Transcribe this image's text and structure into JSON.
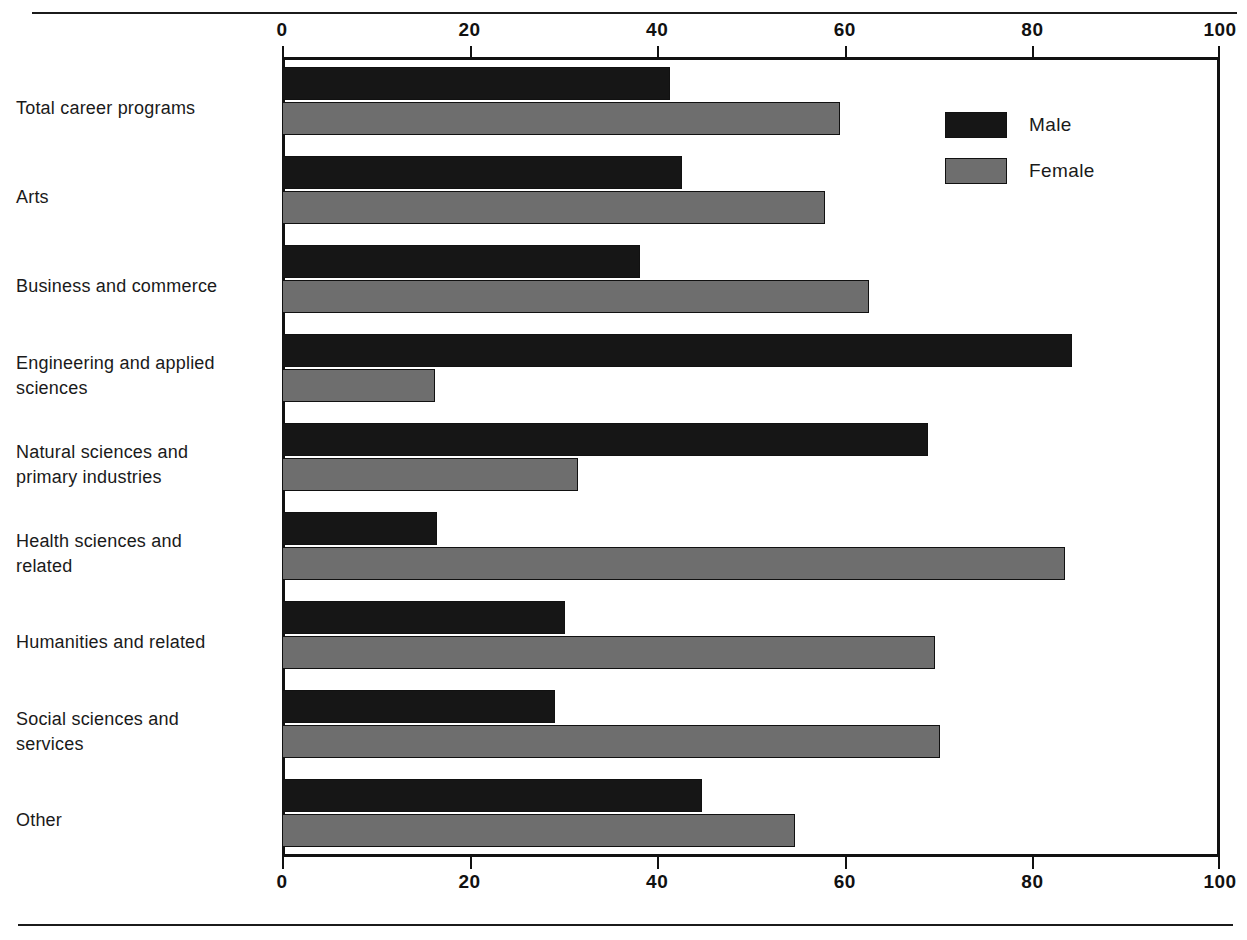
{
  "chart_data": {
    "type": "bar",
    "orientation": "horizontal",
    "title": "",
    "subtitle": "",
    "xlabel": "",
    "ylabel": "",
    "xlim": [
      0,
      100
    ],
    "grid": false,
    "legend_position": "inside-top-right",
    "axes": {
      "top_ticks": [
        "0",
        "20",
        "40",
        "60",
        "80",
        "100"
      ],
      "bottom_ticks": [
        "0",
        "20",
        "40",
        "60",
        "80",
        "100"
      ],
      "tick_values": [
        0,
        20,
        40,
        60,
        80,
        100
      ]
    },
    "categories": [
      "Total career programs",
      "Arts",
      "Business and commerce",
      "Engineering and applied sciences",
      "Natural sciences and primary industries",
      "Health sciences and related",
      "Humanities and related",
      "Social sciences and services",
      "Other"
    ],
    "category_lines": [
      [
        "Total career programs"
      ],
      [
        "Arts"
      ],
      [
        "Business and commerce"
      ],
      [
        "Engineering and applied",
        "sciences"
      ],
      [
        "Natural sciences and",
        "primary industries"
      ],
      [
        "Health sciences and",
        "related"
      ],
      [
        "Humanities and related"
      ],
      [
        "Social sciences and",
        "services"
      ],
      [
        "Other"
      ]
    ],
    "series": [
      {
        "name": "Male",
        "color": "#161616",
        "values": [
          41.4,
          42.6,
          38.2,
          84.2,
          68.9,
          16.5,
          30.2,
          29.1,
          44.8
        ]
      },
      {
        "name": "Female",
        "color": "#6e6e6e",
        "values": [
          59.5,
          57.9,
          62.6,
          16.3,
          31.6,
          83.5,
          69.6,
          70.1,
          54.7
        ]
      }
    ]
  },
  "legend": {
    "items": [
      {
        "label": "Male",
        "color": "#161616"
      },
      {
        "label": "Female",
        "color": "#6e6e6e"
      }
    ]
  }
}
